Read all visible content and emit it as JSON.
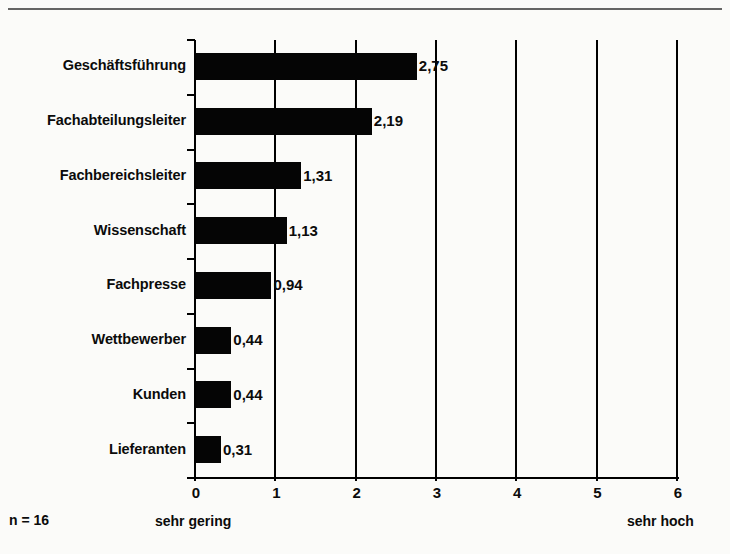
{
  "figure": {
    "cut_off_heading": "",
    "sample_note": "n = 16",
    "scale_low_label": "sehr gering",
    "scale_high_label": "sehr hoch"
  },
  "chart_data": {
    "type": "bar",
    "orientation": "horizontal",
    "title": "",
    "xlabel": "",
    "ylabel": "",
    "xlim": [
      0,
      6
    ],
    "xticks": [
      "0",
      "1",
      "2",
      "3",
      "4",
      "5",
      "6"
    ],
    "grid": "vertical gridlines at every integer tick",
    "legend": "none",
    "decimal_separator": ",",
    "categories": [
      "Geschäftsführung",
      "Fachabteilungsleiter",
      "Fachbereichsleiter",
      "Wissenschaft",
      "Fachpresse",
      "Wettbewerber",
      "Kunden",
      "Lieferanten"
    ],
    "values": [
      2.75,
      2.19,
      1.31,
      1.13,
      0.94,
      0.44,
      0.44,
      0.31
    ],
    "value_labels": [
      "2,75",
      "2,19",
      "1,31",
      "1,13",
      "0,94",
      "0,44",
      "0,44",
      "0,31"
    ],
    "scale_anchor_low": "sehr gering",
    "scale_anchor_high": "sehr hoch",
    "sample_size": "n = 16",
    "bar_color": "#050505",
    "background_color": "#fbfbf9"
  }
}
